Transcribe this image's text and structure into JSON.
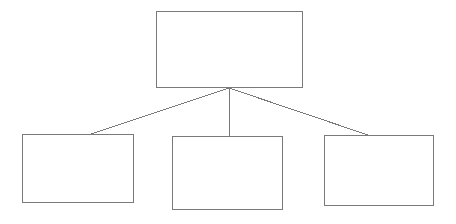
{
  "diagram": {
    "type": "hierarchy-tree",
    "title": "",
    "background_color": "#ffffff",
    "stroke_color": "#7a7a7a",
    "stroke_width": 1,
    "canvas": {
      "width": 456,
      "height": 224
    },
    "nodes": [
      {
        "id": "root",
        "role": "parent",
        "label": "",
        "x": 156,
        "y": 11,
        "width": 147,
        "height": 77
      },
      {
        "id": "child-1",
        "role": "child",
        "label": "",
        "x": 22,
        "y": 134,
        "width": 112,
        "height": 69
      },
      {
        "id": "child-2",
        "role": "child",
        "label": "",
        "x": 172,
        "y": 136,
        "width": 111,
        "height": 74
      },
      {
        "id": "child-3",
        "role": "child",
        "label": "",
        "x": 324,
        "y": 135,
        "width": 110,
        "height": 71
      }
    ],
    "connectors": [
      {
        "id": "root-to-child-1",
        "from": "root",
        "to": "child-1",
        "x1": 229,
        "y1": 88,
        "x2": 88,
        "y2": 135,
        "label": ""
      },
      {
        "id": "root-to-child-2",
        "from": "root",
        "to": "child-2",
        "x1": 229,
        "y1": 88,
        "x2": 229,
        "y2": 136,
        "label": ""
      },
      {
        "id": "root-to-child-3",
        "from": "root",
        "to": "child-3",
        "x1": 229,
        "y1": 88,
        "x2": 368,
        "y2": 135,
        "label": ""
      }
    ],
    "junction": {
      "x": 229,
      "y": 88
    }
  }
}
